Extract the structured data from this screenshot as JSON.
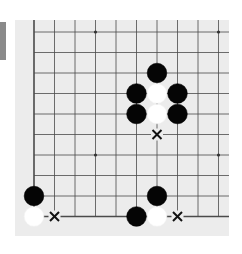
{
  "board": {
    "background": "#ececec",
    "line_color": "#4a4a4a",
    "columns": 10,
    "rows": 10,
    "origin": {
      "x": 34,
      "y": 32
    },
    "spacing": 20.5,
    "edges": {
      "left": true,
      "bottom": true,
      "top": false,
      "right": false
    },
    "star_points": [
      {
        "col": 3,
        "row": 0
      },
      {
        "col": 9,
        "row": 0
      },
      {
        "col": 3,
        "row": 6
      },
      {
        "col": 9,
        "row": 6
      }
    ]
  },
  "stones": [
    {
      "color": "black",
      "col": 6,
      "row": 2
    },
    {
      "color": "black",
      "col": 5,
      "row": 3
    },
    {
      "color": "white",
      "col": 6,
      "row": 3
    },
    {
      "color": "black",
      "col": 7,
      "row": 3
    },
    {
      "color": "black",
      "col": 5,
      "row": 4
    },
    {
      "color": "white",
      "col": 6,
      "row": 4
    },
    {
      "color": "black",
      "col": 7,
      "row": 4
    },
    {
      "color": "black",
      "col": 0,
      "row": 8
    },
    {
      "color": "white",
      "col": 0,
      "row": 9
    },
    {
      "color": "black",
      "col": 6,
      "row": 8
    },
    {
      "color": "black",
      "col": 5,
      "row": 9
    },
    {
      "color": "white",
      "col": 6,
      "row": 9
    }
  ],
  "markers": [
    {
      "type": "x-mark",
      "col": 6,
      "row": 5
    },
    {
      "type": "x-mark",
      "col": 1,
      "row": 9
    },
    {
      "type": "x-mark",
      "col": 7,
      "row": 9
    }
  ],
  "side_tab": {
    "color": "#8a8a8a"
  }
}
